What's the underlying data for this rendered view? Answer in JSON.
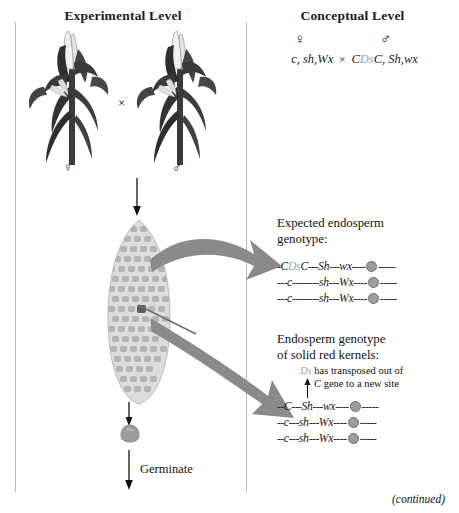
{
  "columns": {
    "experimental_title": "Experimental Level",
    "conceptual_title": "Conceptual Level"
  },
  "conceptual_cross": {
    "female_symbol": "♀",
    "male_symbol": "♂",
    "female_genotype_pre": "c, sh,",
    "female_genotype_wx": "Wx",
    "times": "×",
    "male_c1": "C",
    "male_ds": "Ds",
    "male_c2": "C, Sh,",
    "male_wx": "wx",
    "female_full": "c, sh,Wx",
    "male_full": "CDsC, Sh,wx"
  },
  "experimental": {
    "female_plant_symbol": "♀",
    "male_plant_symbol": "♂",
    "cross_symbol": "×",
    "germinate_label": "Germinate"
  },
  "expected_block": {
    "title_line1": "Expected endosperm",
    "title_line2": "genotype:",
    "chromosomes": [
      {
        "id": "expected-1",
        "parts": [
          {
            "t": "-",
            "k": "dash"
          },
          {
            "t": "C",
            "k": "gene"
          },
          {
            "t": "Ds",
            "k": "ds"
          },
          {
            "t": "C",
            "k": "gene"
          },
          {
            "t": "---",
            "k": "dash"
          },
          {
            "t": "Sh",
            "k": "gene"
          },
          {
            "t": "---",
            "k": "dash"
          },
          {
            "t": "wx",
            "k": "gene"
          },
          {
            "t": "----",
            "k": "dash"
          },
          {
            "t": "",
            "k": "centromere"
          },
          {
            "t": "-----",
            "k": "dash"
          }
        ]
      },
      {
        "id": "expected-2",
        "parts": [
          {
            "t": "---",
            "k": "dash"
          },
          {
            "t": "c",
            "k": "gene"
          },
          {
            "t": "--------",
            "k": "dash"
          },
          {
            "t": "sh",
            "k": "gene"
          },
          {
            "t": "---",
            "k": "dash"
          },
          {
            "t": "Wx",
            "k": "gene"
          },
          {
            "t": "----",
            "k": "dash"
          },
          {
            "t": "",
            "k": "centromere"
          },
          {
            "t": "-----",
            "k": "dash"
          }
        ]
      },
      {
        "id": "expected-3",
        "parts": [
          {
            "t": "---",
            "k": "dash"
          },
          {
            "t": "c",
            "k": "gene"
          },
          {
            "t": "--------",
            "k": "dash"
          },
          {
            "t": "sh",
            "k": "gene"
          },
          {
            "t": "---",
            "k": "dash"
          },
          {
            "t": "Wx",
            "k": "gene"
          },
          {
            "t": "----",
            "k": "dash"
          },
          {
            "t": "",
            "k": "centromere"
          },
          {
            "t": "-----",
            "k": "dash"
          }
        ]
      }
    ]
  },
  "solid_block": {
    "title_line1": "Endosperm genotype",
    "title_line2": "of solid red kernels:",
    "note_ds": "Ds",
    "note_line1_rest": " has transposed out of",
    "note_gene": "C",
    "note_line2_rest": " gene to a new site",
    "chromosomes": [
      {
        "id": "solid-1",
        "parts": [
          {
            "t": "--",
            "k": "dash"
          },
          {
            "t": "C",
            "k": "gene"
          },
          {
            "t": "---",
            "k": "dash"
          },
          {
            "t": "Sh",
            "k": "gene"
          },
          {
            "t": "---",
            "k": "dash"
          },
          {
            "t": "wx",
            "k": "gene"
          },
          {
            "t": "----",
            "k": "dash"
          },
          {
            "t": "",
            "k": "centromere"
          },
          {
            "t": "-----",
            "k": "dash"
          }
        ]
      },
      {
        "id": "solid-2",
        "parts": [
          {
            "t": "--",
            "k": "dash"
          },
          {
            "t": "c",
            "k": "gene"
          },
          {
            "t": "---",
            "k": "dash"
          },
          {
            "t": "sh",
            "k": "gene"
          },
          {
            "t": "---",
            "k": "dash"
          },
          {
            "t": "Wx",
            "k": "gene"
          },
          {
            "t": "----",
            "k": "dash"
          },
          {
            "t": "",
            "k": "centromere"
          },
          {
            "t": "-----",
            "k": "dash"
          }
        ]
      },
      {
        "id": "solid-3",
        "parts": [
          {
            "t": "--",
            "k": "dash"
          },
          {
            "t": "c",
            "k": "gene"
          },
          {
            "t": "---",
            "k": "dash"
          },
          {
            "t": "sh",
            "k": "gene"
          },
          {
            "t": "---",
            "k": "dash"
          },
          {
            "t": "Wx",
            "k": "gene"
          },
          {
            "t": "----",
            "k": "dash"
          },
          {
            "t": "",
            "k": "centromere"
          },
          {
            "t": "-----",
            "k": "dash"
          }
        ]
      }
    ]
  },
  "footer": {
    "continued": "(continued)"
  },
  "colors": {
    "ds_element": "#9aa6bb",
    "centromere_fill": "#9c9c9c",
    "centromere_stroke": "#6d6d6d",
    "big_arrow": "#8a8a8a",
    "plant_dark": "#3a3a3a",
    "ear_light": "#d8d8d8",
    "rule": "#b9b9b9"
  }
}
